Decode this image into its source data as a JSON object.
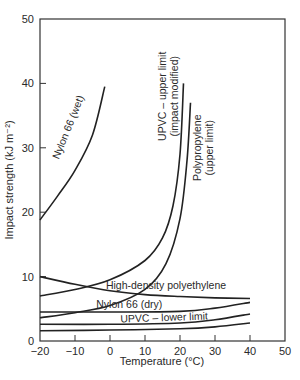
{
  "chart_data": {
    "type": "line",
    "title": "",
    "xlabel": "Temperature (°C)",
    "ylabel": "Impact strength (kJ m⁻²)",
    "xlim": [
      -20,
      50
    ],
    "ylim": [
      0,
      50
    ],
    "x_ticks": [
      -20,
      -10,
      0,
      10,
      20,
      30,
      40,
      50
    ],
    "y_ticks": [
      0,
      10,
      20,
      30,
      40,
      50
    ],
    "grid": false,
    "legend": "inline labels",
    "series": [
      {
        "name": "Nylon 66 (wet)",
        "x": [
          -20,
          -15,
          -10,
          -5,
          -1.5
        ],
        "y": [
          18.8,
          22.5,
          26.5,
          32,
          39.5
        ]
      },
      {
        "name": "UPVC – upper limit (impact modified)",
        "x": [
          -20,
          -10,
          0,
          10,
          15,
          18,
          20,
          21
        ],
        "y": [
          7,
          8,
          9.5,
          12.5,
          16,
          21,
          29,
          40
        ]
      },
      {
        "name": "Polypropylene (upper limit)",
        "x": [
          -20,
          -10,
          0,
          10,
          16,
          20,
          22,
          23
        ],
        "y": [
          3.6,
          4.4,
          5.5,
          8,
          12,
          19,
          28,
          37
        ]
      },
      {
        "name": "High-density polyethylene",
        "x": [
          -20,
          -10,
          0,
          10,
          20,
          30,
          40
        ],
        "y": [
          10,
          8.8,
          7.8,
          7.2,
          6.9,
          6.7,
          6.6
        ]
      },
      {
        "name": "Nylon 66 (dry)",
        "x": [
          -20,
          0,
          20,
          30,
          40
        ],
        "y": [
          4.5,
          4.5,
          4.6,
          5.1,
          6
        ]
      },
      {
        "name": "UPVC – lower limit",
        "x": [
          -20,
          0,
          20,
          30,
          40
        ],
        "y": [
          2.6,
          2.6,
          2.8,
          3.3,
          4.2
        ]
      },
      {
        "name": "(unlabeled lower curve)",
        "x": [
          -20,
          0,
          20,
          30,
          40
        ],
        "y": [
          1.6,
          1.7,
          1.9,
          2.2,
          2.8
        ]
      }
    ],
    "annotations": [
      {
        "text": "Nylon 66 (wet)",
        "x": -11,
        "y": 33,
        "rotation": -68
      },
      {
        "text": "UPVC – upper limit",
        "x": 16,
        "y": 38,
        "rotation": -90
      },
      {
        "text": "(impact modified)",
        "x": 19.5,
        "y": 38,
        "rotation": -90
      },
      {
        "text": "Polypropylene",
        "x": 26,
        "y": 30,
        "rotation": -90
      },
      {
        "text": "(upper limit)",
        "x": 29.5,
        "y": 30,
        "rotation": -90
      },
      {
        "text": "High-density polyethylene",
        "x": 16,
        "y": 8,
        "rotation": 0
      },
      {
        "text": "Nylon 66 (dry)",
        "x": 5.5,
        "y": 5.1,
        "rotation": 0
      },
      {
        "text": "UPVC – lower limit",
        "x": 15.5,
        "y": 3.1,
        "rotation": -2
      }
    ]
  }
}
